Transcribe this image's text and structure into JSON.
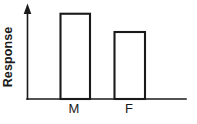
{
  "chart_data": {
    "type": "bar",
    "title": "",
    "subtitle": "",
    "xlabel": "",
    "ylabel": "Response",
    "categories": [
      "M",
      "F"
    ],
    "values": [
      0.98,
      0.77
    ],
    "ylim": [
      0,
      1
    ],
    "grid": false,
    "legend": null,
    "annotations": [],
    "style": {
      "bar_fill": "#ffffff",
      "bar_stroke": "#1a1a1a",
      "axis_color": "#1a1a1a",
      "background": "#ffffff",
      "y_axis_has_arrow": true,
      "y_axis_ticks_shown": false,
      "x_axis_ticks_shown": false
    }
  },
  "axes": {
    "y_label": "Response",
    "x_tick_labels": [
      "M",
      "F"
    ]
  },
  "bars": [
    {
      "category": "M",
      "label": "M",
      "value": 0.98
    },
    {
      "category": "F",
      "label": "F",
      "value": 0.77
    }
  ]
}
